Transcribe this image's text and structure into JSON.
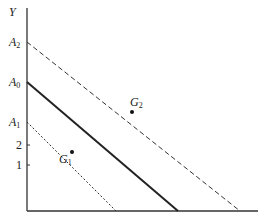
{
  "diagram": {
    "type": "budget-line diagram",
    "axes": {
      "x_label": "X",
      "y_label": "Y",
      "origin_label": "O"
    },
    "y_ticks": [
      {
        "label": "A",
        "sub": "2",
        "value_y": 42
      },
      {
        "label": "A",
        "sub": "0",
        "value_y": 82
      },
      {
        "label": "A",
        "sub": "1",
        "value_y": 122
      },
      {
        "label": "2",
        "sub": "",
        "value_y": 145
      },
      {
        "label": "1",
        "sub": "",
        "value_y": 165
      }
    ],
    "x_ticks": [
      {
        "label": "B",
        "sub": "1"
      },
      {
        "label": "B",
        "sub": "0"
      },
      {
        "label": "B",
        "sub": "2"
      }
    ],
    "lines": [
      {
        "name": "A2B2",
        "from": "A2",
        "to": "B2",
        "style": "dashed"
      },
      {
        "name": "A0B0",
        "from": "A0",
        "to": "B0",
        "style": "solid"
      },
      {
        "name": "A1B1",
        "from": "A1",
        "to": "B1",
        "style": "dotted"
      }
    ],
    "points": [
      {
        "label": "G",
        "sub": "2",
        "on": "A2B2"
      },
      {
        "label": "G",
        "sub": "1",
        "on": "A1B1"
      }
    ],
    "colors": {
      "line": "#222222",
      "background": "#ffffff"
    }
  }
}
